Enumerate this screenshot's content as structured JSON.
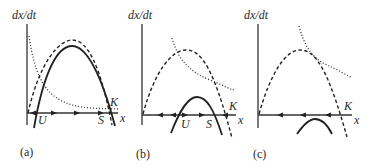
{
  "figure": {
    "panels": [
      {
        "id": "a",
        "caption": "(a)",
        "y_axis_label": "dx/dt",
        "x_axis_label": "x",
        "points": {
          "U": "U",
          "S": "S",
          "K": "K"
        },
        "flow_directions": [
          "left",
          "right",
          "right",
          "left"
        ]
      },
      {
        "id": "b",
        "caption": "(b)",
        "y_axis_label": "dx/dt",
        "x_axis_label": "x",
        "points": {
          "U": "U",
          "S": "S",
          "K": "K"
        },
        "flow_directions": [
          "left",
          "left",
          "right",
          "right",
          "left"
        ]
      },
      {
        "id": "c",
        "caption": "(c)",
        "y_axis_label": "dx/dt",
        "x_axis_label": "x",
        "points": {
          "K": "K"
        },
        "flow_directions": [
          "left",
          "left",
          "left"
        ]
      }
    ],
    "legend_styles": {
      "solid": "net growth rate curve",
      "dashed": "logistic growth curve",
      "dotted": "harvest/loss curve"
    }
  }
}
